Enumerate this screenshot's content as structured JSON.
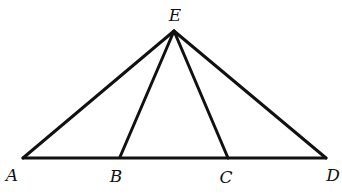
{
  "diagram": {
    "type": "geometry-figure",
    "points": {
      "E": {
        "label": "E",
        "x": 174,
        "y": 31,
        "lx": 175,
        "ly": 21
      },
      "A": {
        "label": "A",
        "x": 23,
        "y": 158,
        "lx": 12,
        "ly": 181
      },
      "B": {
        "label": "B",
        "x": 120,
        "y": 157,
        "lx": 116,
        "ly": 182
      },
      "C": {
        "label": "C",
        "x": 228,
        "y": 158,
        "lx": 226,
        "ly": 183
      },
      "D": {
        "label": "D",
        "x": 326,
        "y": 158,
        "lx": 333,
        "ly": 181
      }
    },
    "segments": [
      {
        "from": "A",
        "to": "D"
      },
      {
        "from": "E",
        "to": "A"
      },
      {
        "from": "E",
        "to": "B"
      },
      {
        "from": "E",
        "to": "C"
      },
      {
        "from": "E",
        "to": "D"
      }
    ],
    "line_color": "#111111",
    "background": "#ffffff"
  }
}
